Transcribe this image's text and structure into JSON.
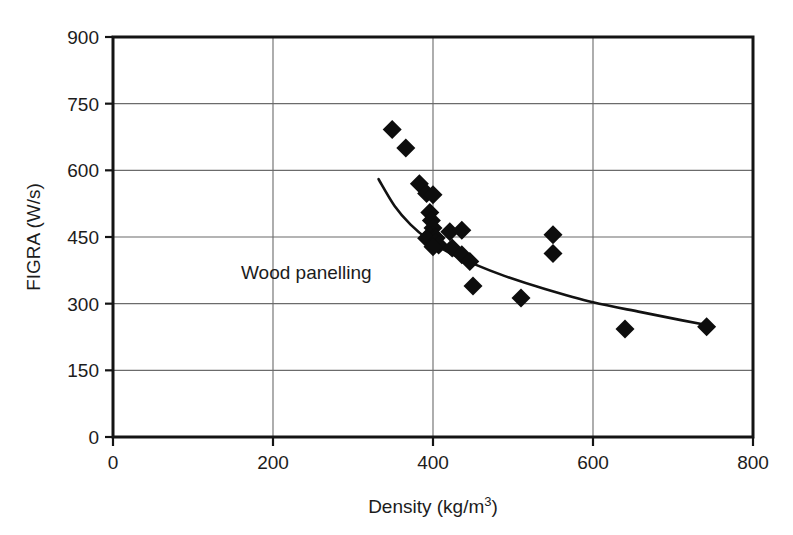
{
  "chart_data": {
    "type": "scatter",
    "title": "",
    "subtitle": "",
    "xlabel": "Density (kg/m3)",
    "xlabel_base": "Density (kg/m",
    "xlabel_sup": "3",
    "xlabel_tail": ")",
    "ylabel": "FIGRA (W/s)",
    "xlim": [
      0,
      800
    ],
    "ylim": [
      0,
      900
    ],
    "xticks": [
      0,
      200,
      400,
      600,
      800
    ],
    "yticks": [
      0,
      150,
      300,
      450,
      600,
      750,
      900
    ],
    "xtick_labels": [
      "0",
      "200",
      "400",
      "600",
      "800"
    ],
    "ytick_labels": [
      "0",
      "150",
      "300",
      "450",
      "600",
      "750",
      "900"
    ],
    "grid": "horizontal-and-vertical",
    "legend": "none",
    "marker": "filled-diamond",
    "marker_color": "#0d0d0d",
    "line_color": "#121212",
    "annotations": [
      {
        "text": "Wood panelling",
        "x": 160,
        "y": 355
      }
    ],
    "series": [
      {
        "name": "Wood panelling",
        "points": [
          [
            349,
            692
          ],
          [
            366,
            650
          ],
          [
            383,
            570
          ],
          [
            392,
            548
          ],
          [
            400,
            545
          ],
          [
            396,
            505
          ],
          [
            398,
            487
          ],
          [
            400,
            470
          ],
          [
            399,
            455
          ],
          [
            396,
            452
          ],
          [
            402,
            450
          ],
          [
            404,
            448
          ],
          [
            392,
            447
          ],
          [
            403,
            437
          ],
          [
            407,
            432
          ],
          [
            400,
            428
          ],
          [
            421,
            462
          ],
          [
            436,
            465
          ],
          [
            424,
            425
          ],
          [
            436,
            410
          ],
          [
            446,
            395
          ],
          [
            450,
            340
          ],
          [
            510,
            313
          ],
          [
            550,
            455
          ],
          [
            550,
            413
          ],
          [
            640,
            243
          ],
          [
            742,
            248
          ]
        ]
      }
    ],
    "trend_curve": {
      "name": "power-law fit",
      "points": [
        [
          332,
          580
        ],
        [
          352,
          520
        ],
        [
          372,
          478
        ],
        [
          395,
          443
        ],
        [
          420,
          415
        ],
        [
          450,
          390
        ],
        [
          490,
          362
        ],
        [
          540,
          333
        ],
        [
          600,
          303
        ],
        [
          660,
          281
        ],
        [
          710,
          263
        ],
        [
          742,
          252
        ]
      ]
    }
  },
  "layout": {
    "plot_left": 113,
    "plot_right": 753,
    "plot_top": 37,
    "plot_bottom": 437
  }
}
